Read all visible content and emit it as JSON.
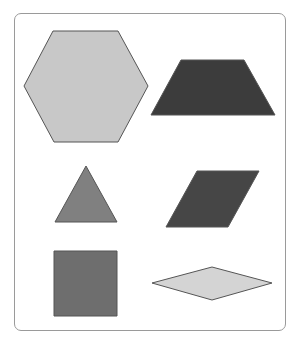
{
  "figure": {
    "frame": {
      "stroke": "#9a9a9a"
    },
    "shapes": [
      {
        "name": "hexagon",
        "fill": "#c8c8c8",
        "points": "53,31 118,31 148,86 118,142 54,142 24,86"
      },
      {
        "name": "trapezoid",
        "fill": "#3c3c3c",
        "points": "181,60 244,60 275,115 151,115"
      },
      {
        "name": "triangle",
        "fill": "#808080",
        "points": "86,166 117,222 55,222"
      },
      {
        "name": "parallelogram",
        "fill": "#464646",
        "points": "197,171 259,171 228,227 166,227"
      },
      {
        "name": "square",
        "fill": "#6e6e6e",
        "points": "54,251 117,251 117,316 54,316"
      },
      {
        "name": "rhombus",
        "fill": "#d4d4d4",
        "points": "152,283 212,267 272,283 212,300"
      }
    ]
  }
}
